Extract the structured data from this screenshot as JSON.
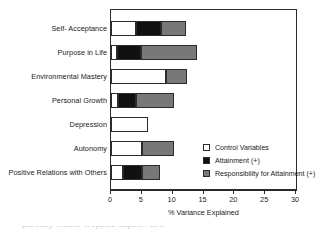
{
  "chart_data": {
    "type": "bar",
    "orientation": "horizontal",
    "stacked": true,
    "title": "",
    "xlabel": "% Variance Explained",
    "ylabel": "",
    "xlim": [
      0,
      30
    ],
    "xticks": [
      0,
      5,
      10,
      15,
      20,
      25,
      30
    ],
    "xtick_labels": [
      "0",
      "5",
      "10",
      "15",
      "20",
      "25",
      "30"
    ],
    "grid": false,
    "legend_position": "inside-lower-right",
    "categories": [
      "Self- Acceptance",
      "Purpose in Life",
      "Environmental Mastery",
      "Personal Growth",
      "Depression",
      "Autonomy",
      "Positive Relations with Others"
    ],
    "series": [
      {
        "name": "Control Variables",
        "color": "#ffffff",
        "values": [
          4.1,
          1.0,
          8.9,
          1.1,
          6.0,
          5.0,
          2.0
        ]
      },
      {
        "name": "Attainment (+)",
        "color": "#111111",
        "values": [
          4.0,
          3.9,
          0.0,
          2.9,
          0.0,
          0.0,
          3.0
        ]
      },
      {
        "name": "Responsibility for Attainment (+)",
        "color": "#787878",
        "values": [
          4.1,
          9.1,
          3.4,
          6.2,
          0.0,
          5.2,
          3.0
        ]
      }
    ],
    "totals": [
      12.2,
      14.0,
      12.3,
      10.2,
      6.0,
      10.2,
      8.0
    ]
  },
  "legend": {
    "items": [
      {
        "label": "Control Variables",
        "swatch": "control"
      },
      {
        "label": "Attainment (+)",
        "swatch": "attain"
      },
      {
        "label": "Responsibility for Attainment (+)",
        "swatch": "resp"
      }
    ]
  },
  "caption": {
    "cropped_line": "partially visible cropped caption text"
  }
}
